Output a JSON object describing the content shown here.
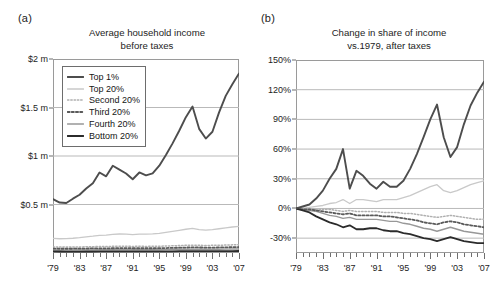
{
  "figure": {
    "panels": [
      {
        "label": "(a)",
        "title_line1": "Average household income",
        "title_line2": "before taxes"
      },
      {
        "label": "(b)",
        "title_line1": "Change in share of income",
        "title_line2": "vs.1979, after taxes"
      }
    ]
  },
  "legend": {
    "entries": [
      {
        "label": "Top 1%",
        "color": "#4d4d4d",
        "style": "solid-thick"
      },
      {
        "label": "Top 20%",
        "color": "#c9c9c9",
        "style": "solid-thin"
      },
      {
        "label": "Second 20%",
        "color": "#b0b0b0",
        "style": "dotted-fine"
      },
      {
        "label": "Third 20%",
        "color": "#5a5a5a",
        "style": "dotted-bold"
      },
      {
        "label": "Fourth 20%",
        "color": "#989898",
        "style": "solid-med"
      },
      {
        "label": "Bottom 20%",
        "color": "#2b2b2b",
        "style": "solid-thick"
      }
    ]
  },
  "colors": {
    "axis": "#9a9a9a",
    "grid": "#b9b9b9",
    "tick": "#6f6f6f",
    "text": "#1d1d1d",
    "top1": "#4d4d4d",
    "top20": "#c9c9c9",
    "second20": "#b0b0b0",
    "third20": "#5a5a5a",
    "fourth20": "#989898",
    "bottom20": "#2b2b2b"
  },
  "chart_data": [
    {
      "type": "line",
      "panel": "(a)",
      "title": "Average household income before taxes",
      "xlabel": "",
      "ylabel": "",
      "xlim": [
        1979,
        2007
      ],
      "ylim": [
        0,
        2000000
      ],
      "grid": true,
      "legend_position": "top-left",
      "ytick_values": [
        2000000,
        1500000,
        1000000,
        500000
      ],
      "ytick_labels": [
        "$2 m",
        "$1.5 m",
        "$1 m",
        "$0.5 m"
      ],
      "xtick_values": [
        1979,
        1983,
        1987,
        1991,
        1995,
        1999,
        2003,
        2007
      ],
      "xtick_labels": [
        "'79",
        "'83",
        "'87",
        "'91",
        "'95",
        "'99",
        "'03",
        "'07"
      ],
      "x": [
        1979,
        1980,
        1981,
        1982,
        1983,
        1984,
        1985,
        1986,
        1987,
        1988,
        1989,
        1990,
        1991,
        1992,
        1993,
        1994,
        1995,
        1996,
        1997,
        1998,
        1999,
        2000,
        2001,
        2002,
        2003,
        2004,
        2005,
        2006,
        2007
      ],
      "series": [
        {
          "name": "Top 1%",
          "values": [
            555000,
            520000,
            515000,
            560000,
            600000,
            665000,
            720000,
            830000,
            790000,
            900000,
            860000,
            820000,
            760000,
            830000,
            800000,
            820000,
            900000,
            1010000,
            1130000,
            1260000,
            1400000,
            1510000,
            1280000,
            1180000,
            1250000,
            1450000,
            1620000,
            1740000,
            1850000
          ]
        },
        {
          "name": "Top 20%",
          "values": [
            150000,
            147000,
            148000,
            152000,
            158000,
            167000,
            173000,
            181000,
            184000,
            193000,
            196000,
            194000,
            190000,
            195000,
            194000,
            197000,
            203000,
            212000,
            222000,
            233000,
            245000,
            254000,
            241000,
            236000,
            240000,
            250000,
            260000,
            268000,
            274000
          ]
        },
        {
          "name": "Second 20%",
          "values": [
            62000,
            61000,
            61000,
            61000,
            62000,
            64000,
            65000,
            67000,
            67000,
            69000,
            70000,
            69000,
            68000,
            69000,
            68000,
            69000,
            70000,
            72000,
            74000,
            77000,
            79000,
            81000,
            79000,
            78000,
            79000,
            80000,
            82000,
            84000,
            85000
          ]
        },
        {
          "name": "Third 20%",
          "values": [
            45000,
            44000,
            44000,
            44000,
            45000,
            46000,
            47000,
            48000,
            48000,
            49000,
            50000,
            50000,
            49000,
            49000,
            49000,
            49000,
            50000,
            51000,
            53000,
            55000,
            56000,
            58000,
            57000,
            56000,
            56000,
            57000,
            58000,
            60000,
            61000
          ]
        },
        {
          "name": "Fourth 20%",
          "values": [
            31000,
            30000,
            30000,
            30000,
            31000,
            32000,
            32000,
            33000,
            33000,
            34000,
            35000,
            34000,
            34000,
            34000,
            34000,
            34000,
            34000,
            35000,
            36000,
            38000,
            39000,
            40000,
            39000,
            38000,
            38000,
            39000,
            40000,
            41000,
            42000
          ]
        },
        {
          "name": "Bottom 20%",
          "values": [
            16000,
            15500,
            15000,
            15000,
            15000,
            15500,
            15500,
            16000,
            16000,
            16500,
            17000,
            16500,
            16000,
            16000,
            16000,
            16000,
            16500,
            17000,
            17500,
            18500,
            19000,
            19500,
            19000,
            18500,
            18500,
            19000,
            19500,
            20000,
            20500
          ]
        }
      ]
    },
    {
      "type": "line",
      "panel": "(b)",
      "title": "Change in share of income vs.1979, after taxes",
      "xlabel": "",
      "ylabel": "",
      "xlim": [
        1979,
        2007
      ],
      "ylim": [
        -45,
        150
      ],
      "grid": true,
      "legend_position": "none",
      "ytick_values": [
        150,
        120,
        90,
        60,
        30,
        0,
        -30
      ],
      "ytick_labels": [
        "150%",
        "120%",
        "90%",
        "60%",
        "30%",
        "0%",
        "-30%"
      ],
      "xtick_values": [
        1979,
        1983,
        1987,
        1991,
        1995,
        1999,
        2003,
        2007
      ],
      "xtick_labels": [
        "'79",
        "'83",
        "'87",
        "'91",
        "'95",
        "'99",
        "'03",
        "'07"
      ],
      "x": [
        1979,
        1980,
        1981,
        1982,
        1983,
        1984,
        1985,
        1986,
        1987,
        1988,
        1989,
        1990,
        1991,
        1992,
        1993,
        1994,
        1995,
        1996,
        1997,
        1998,
        1999,
        2000,
        2001,
        2002,
        2003,
        2004,
        2005,
        2006,
        2007
      ],
      "series": [
        {
          "name": "Top 1%",
          "values": [
            0,
            2,
            4,
            10,
            18,
            30,
            40,
            60,
            20,
            38,
            33,
            25,
            20,
            27,
            22,
            22,
            28,
            40,
            55,
            72,
            90,
            105,
            72,
            52,
            62,
            85,
            104,
            117,
            128
          ]
        },
        {
          "name": "Top 20%",
          "values": [
            0,
            0,
            1,
            2,
            3,
            5,
            6,
            9,
            5,
            9,
            9,
            8,
            7,
            9,
            9,
            9,
            11,
            13,
            16,
            19,
            22,
            24,
            18,
            16,
            18,
            21,
            24,
            26,
            28
          ]
        },
        {
          "name": "Second 20%",
          "values": [
            0,
            0,
            0,
            -1,
            -1,
            -1,
            -2,
            -3,
            -2,
            -3,
            -3,
            -3,
            -3,
            -4,
            -4,
            -4,
            -5,
            -5,
            -6,
            -7,
            -8,
            -9,
            -8,
            -7,
            -8,
            -9,
            -10,
            -11,
            -11
          ]
        },
        {
          "name": "Third 20%",
          "values": [
            0,
            -1,
            -1,
            -2,
            -3,
            -4,
            -5,
            -6,
            -5,
            -7,
            -7,
            -7,
            -7,
            -8,
            -8,
            -9,
            -10,
            -11,
            -12,
            -14,
            -15,
            -16,
            -14,
            -13,
            -14,
            -16,
            -17,
            -18,
            -19
          ]
        },
        {
          "name": "Fourth 20%",
          "values": [
            0,
            -1,
            -2,
            -3,
            -5,
            -7,
            -8,
            -10,
            -9,
            -11,
            -11,
            -11,
            -11,
            -12,
            -13,
            -13,
            -15,
            -16,
            -18,
            -20,
            -21,
            -23,
            -21,
            -19,
            -21,
            -23,
            -24,
            -25,
            -26
          ]
        },
        {
          "name": "Bottom 20%",
          "values": [
            0,
            -2,
            -4,
            -8,
            -11,
            -14,
            -16,
            -19,
            -17,
            -21,
            -21,
            -20,
            -20,
            -22,
            -23,
            -23,
            -25,
            -26,
            -28,
            -30,
            -31,
            -33,
            -31,
            -29,
            -31,
            -33,
            -34,
            -35,
            -35
          ]
        }
      ]
    }
  ]
}
